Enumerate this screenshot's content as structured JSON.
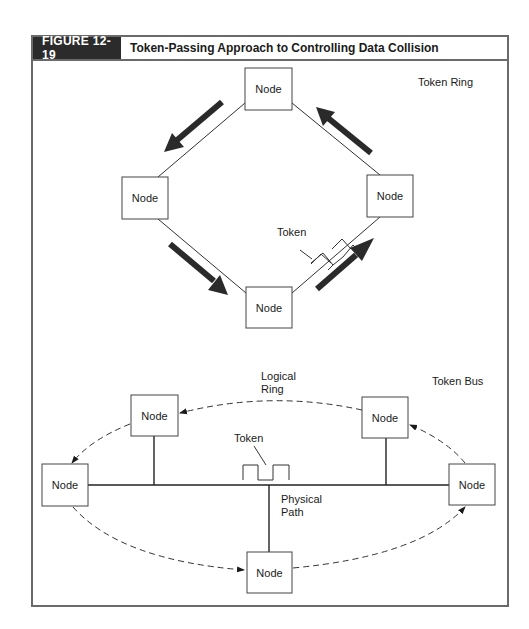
{
  "figure": {
    "label": "FIGURE 12-19",
    "title": "Token-Passing Approach to Controlling Data Collision"
  },
  "token_ring": {
    "heading": "Token Ring",
    "nodes": [
      {
        "id": "top",
        "label": "Node"
      },
      {
        "id": "left",
        "label": "Node"
      },
      {
        "id": "right",
        "label": "Node"
      },
      {
        "id": "bottom",
        "label": "Node"
      }
    ],
    "token_label": "Token",
    "direction": "counter-clockwise"
  },
  "token_bus": {
    "heading": "Token Bus",
    "logical_ring_label_line1": "Logical",
    "logical_ring_label_line2": "Ring",
    "physical_path_label_line1": "Physical",
    "physical_path_label_line2": "Path",
    "token_label": "Token",
    "nodes": [
      {
        "id": "upper-left",
        "label": "Node"
      },
      {
        "id": "upper-right",
        "label": "Node"
      },
      {
        "id": "left",
        "label": "Node"
      },
      {
        "id": "right",
        "label": "Node"
      },
      {
        "id": "bottom",
        "label": "Node"
      }
    ]
  },
  "colors": {
    "frame": "#6a6a6a",
    "label_bg": "#2b2b2b",
    "arrow": "#2a2a2a",
    "line": "#333333"
  }
}
